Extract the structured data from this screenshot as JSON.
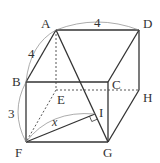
{
  "figure": {
    "type": "rectangular-prism",
    "vertices": {
      "A": {
        "label": "A",
        "x": 56,
        "y": 30
      },
      "D": {
        "label": "D",
        "x": 139,
        "y": 30
      },
      "B": {
        "label": "B",
        "x": 26,
        "y": 82
      },
      "C": {
        "label": "C",
        "x": 108,
        "y": 82
      },
      "E": {
        "label": "E",
        "x": 56,
        "y": 90
      },
      "H": {
        "label": "H",
        "x": 139,
        "y": 90
      },
      "F": {
        "label": "F",
        "x": 26,
        "y": 142
      },
      "G": {
        "label": "G",
        "x": 108,
        "y": 142
      },
      "I": {
        "label": "I",
        "x": 95,
        "y": 114
      }
    },
    "dimensions": {
      "AD": "4",
      "AB": "4",
      "BF": "3",
      "FI": "x"
    },
    "right_angle_at": "I"
  }
}
